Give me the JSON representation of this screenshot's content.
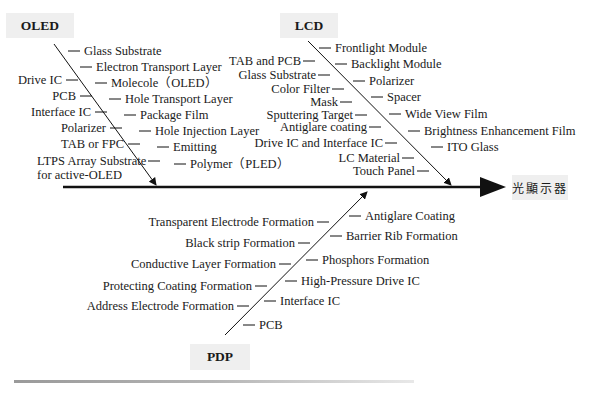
{
  "diagram": {
    "type": "fishbone",
    "effect_label": "光顯示器",
    "categories": [
      {
        "name": "OLED",
        "left_items": [
          "Drive IC",
          "PCB",
          "Interface IC",
          "Polarizer",
          "TAB or FPC",
          "LTPS Array Substrate",
          "for active-OLED"
        ],
        "right_items": [
          "Glass Substrate",
          "Electron Transport Layer",
          "Molecole（OLED）",
          "Hole Transport Layer",
          "Package Film",
          "Hole Injection Layer",
          "Emitting",
          "Polymer（PLED）"
        ]
      },
      {
        "name": "LCD",
        "left_items": [
          "TAB and PCB",
          "Glass Substrate",
          "Color Filter",
          "Mask",
          "Sputtering Target",
          "Antiglare coating",
          "Drive IC and Interface IC",
          "LC Material",
          "Touch Panel"
        ],
        "right_items": [
          "Frontlight Module",
          "Backlight Module",
          "Polarizer",
          "Spacer",
          "Wide View Film",
          "Brightness Enhancement Film",
          "ITO Glass"
        ]
      },
      {
        "name": "PDP",
        "left_items": [
          "Transparent Electrode Formation",
          "Black strip Formation",
          "Conductive Layer Formation",
          "Protecting Coating Formation",
          "Address Electrode Formation"
        ],
        "right_items": [
          "Antiglare Coating",
          "Barrier Rib Formation",
          "Phosphors Formation",
          "High-Pressure Drive IC",
          "Interface IC",
          "PCB"
        ]
      }
    ]
  },
  "colors": {
    "line": "#111111",
    "label_box": "#efefef",
    "text": "#1a1a1a"
  }
}
